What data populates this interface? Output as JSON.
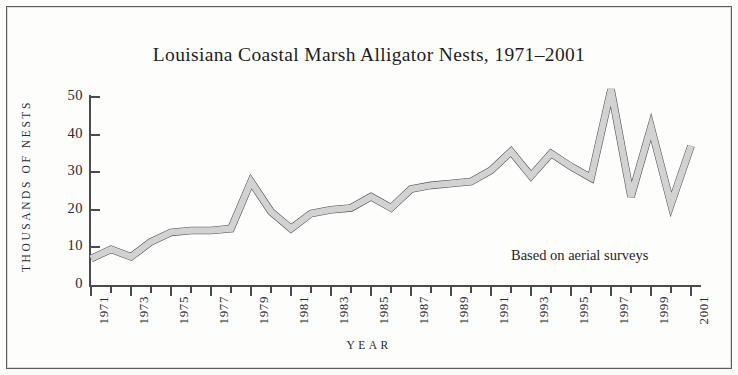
{
  "figure": {
    "title": "Louisiana Coastal Marsh Alligator Nests, 1971–2001",
    "annotation": "Based on aerial surveys",
    "frame_color": "#5d5d62",
    "background": "#fdfdfc"
  },
  "axes": {
    "x_title": "YEAR",
    "y_title": "THOUSANDS OF NESTS",
    "y_ticks": [
      "0",
      "10",
      "20",
      "30",
      "40",
      "50"
    ],
    "x_tick_labels": [
      "1971",
      "1973",
      "1975",
      "1977",
      "1979",
      "1981",
      "1983",
      "1985",
      "1987",
      "1989",
      "1991",
      "1993",
      "1995",
      "1997",
      "1999",
      "2001"
    ]
  },
  "style": {
    "line_fill": "#d2d2d2",
    "line_stroke": "#4f4f54",
    "axis_color": "#4a4a4f",
    "text_color": "#26262a"
  },
  "chart_data": {
    "type": "line",
    "title": "Louisiana Coastal Marsh Alligator Nests, 1971–2001",
    "xlabel": "YEAR",
    "ylabel": "THOUSANDS OF NESTS",
    "xlim": [
      1971,
      2001
    ],
    "ylim": [
      0,
      50
    ],
    "grid": false,
    "legend": "none",
    "annotations": [
      "Based on aerial surveys"
    ],
    "x": [
      1971,
      1972,
      1973,
      1974,
      1975,
      1976,
      1977,
      1978,
      1979,
      1980,
      1981,
      1982,
      1983,
      1984,
      1985,
      1986,
      1987,
      1988,
      1989,
      1990,
      1991,
      1992,
      1993,
      1994,
      1995,
      1996,
      1997,
      1998,
      1999,
      2000,
      2001
    ],
    "series": [
      {
        "name": "Alligator nests (thousands)",
        "values": [
          7.0,
          9.5,
          7.5,
          11.5,
          14.0,
          14.5,
          14.5,
          15.0,
          27.5,
          19.5,
          15.0,
          19.0,
          20.0,
          20.5,
          23.5,
          20.5,
          25.5,
          26.5,
          27.0,
          27.5,
          30.5,
          35.5,
          29.0,
          35.0,
          31.5,
          28.5,
          52.0,
          23.5,
          42.0,
          21.5,
          37.0
        ]
      }
    ]
  }
}
